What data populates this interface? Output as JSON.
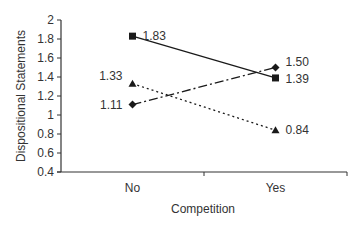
{
  "chart_data": {
    "type": "line",
    "title": "",
    "xlabel": "Competition",
    "ylabel": "Dispositional Statements",
    "categories": [
      "No",
      "Yes"
    ],
    "ylim": [
      0.4,
      2
    ],
    "yticks": [
      0.4,
      0.6,
      0.8,
      1,
      1.2,
      1.4,
      1.6,
      1.8,
      2
    ],
    "ytick_labels": [
      "0.4",
      "0.6",
      "0.8",
      "1",
      "1.2",
      "1.4",
      "1.6",
      "1.8",
      "2"
    ],
    "grid": false,
    "legend": null,
    "series": [
      {
        "name": "Series A (square, solid)",
        "marker": "square",
        "line": "solid",
        "values": [
          1.83,
          1.39
        ],
        "labels": [
          "1.83",
          "1.39"
        ]
      },
      {
        "name": "Series B (diamond, dash-dot)",
        "marker": "diamond",
        "line": "dash-dot",
        "values": [
          1.11,
          1.5
        ],
        "labels": [
          "1.11",
          "1.50"
        ]
      },
      {
        "name": "Series C (triangle, dotted)",
        "marker": "triangle",
        "line": "dotted",
        "values": [
          1.33,
          0.84
        ],
        "labels": [
          "1.33",
          "0.84"
        ]
      }
    ]
  },
  "colors": {
    "line": "#1a1a1a",
    "text": "#333333",
    "axis": "#333333"
  }
}
